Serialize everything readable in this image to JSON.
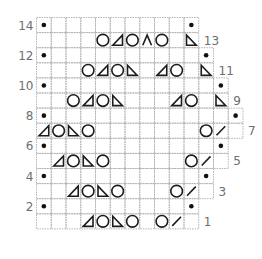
{
  "chart": {
    "legend_symbols": {
      "O": "yarn-over (circle)",
      "L": "left-slanting triangle (ssk-style decrease)",
      "R": "right-slanting triangle (k2tog-style decrease)",
      "A": "double decrease (inverted V)",
      "/": "slash (right-leaning decrease)",
      ".": "purl dot",
      "": "knit (empty square)"
    },
    "colors": {
      "grid": "#b4b4b4",
      "symbol": "#1c1c1c",
      "label": "#6e6e6e"
    },
    "rows": [
      {
        "num": 14,
        "label": "14",
        "side": "left",
        "cells": [
          ".",
          "",
          "",
          "",
          "",
          "",
          "",
          "",
          "",
          "",
          "."
        ]
      },
      {
        "num": 13,
        "label": "13",
        "side": "right",
        "cells": [
          "",
          "",
          "",
          "",
          "O",
          "L",
          "O",
          "A",
          "O",
          "",
          "R"
        ]
      },
      {
        "num": 12,
        "label": "12",
        "side": "left",
        "cells": [
          ".",
          "",
          "",
          "",
          "",
          "",
          "",
          "",
          "",
          "",
          "",
          "."
        ]
      },
      {
        "num": 11,
        "label": "11",
        "side": "right",
        "cells": [
          "",
          "",
          "",
          "O",
          "L",
          "O",
          "R",
          "",
          "L",
          "O",
          "",
          "R"
        ]
      },
      {
        "num": 10,
        "label": "10",
        "side": "left",
        "cells": [
          ".",
          "",
          "",
          "",
          "",
          "",
          "",
          "",
          "",
          "",
          "",
          "",
          "."
        ]
      },
      {
        "num": 9,
        "label": "9",
        "side": "right",
        "cells": [
          "",
          "",
          "O",
          "L",
          "O",
          "R",
          "",
          "",
          "",
          "L",
          "O",
          "",
          "R"
        ]
      },
      {
        "num": 8,
        "label": "8",
        "side": "left",
        "cells": [
          ".",
          "",
          "",
          "",
          "",
          "",
          "",
          "",
          "",
          "",
          "",
          "",
          "",
          "."
        ]
      },
      {
        "num": 7,
        "label": "7",
        "side": "right",
        "cells": [
          "L",
          "O",
          "R",
          "O",
          "",
          "",
          "",
          "",
          "",
          "",
          "",
          "O",
          "/",
          ""
        ]
      },
      {
        "num": 6,
        "label": "6",
        "side": "left",
        "cells": [
          ".",
          "",
          "",
          "",
          "",
          "",
          "",
          "",
          "",
          "",
          "",
          "",
          "."
        ]
      },
      {
        "num": 5,
        "label": "5",
        "side": "right",
        "cells": [
          "",
          "L",
          "O",
          "R",
          "O",
          "",
          "",
          "",
          "",
          "",
          "O",
          "/",
          ""
        ]
      },
      {
        "num": 4,
        "label": "4",
        "side": "left",
        "cells": [
          ".",
          "",
          "",
          "",
          "",
          "",
          "",
          "",
          "",
          "",
          "",
          "."
        ]
      },
      {
        "num": 3,
        "label": "3",
        "side": "right",
        "cells": [
          "",
          "",
          "L",
          "O",
          "R",
          "O",
          "",
          "",
          "",
          "O",
          "/",
          ""
        ]
      },
      {
        "num": 2,
        "label": "2",
        "side": "left",
        "cells": [
          ".",
          "",
          "",
          "",
          "",
          "",
          "",
          "",
          "",
          "",
          "."
        ]
      },
      {
        "num": 1,
        "label": "1",
        "side": "right",
        "cells": [
          "",
          "",
          "",
          "L",
          "O",
          "R",
          "O",
          "",
          "O",
          "/",
          ""
        ]
      }
    ]
  }
}
